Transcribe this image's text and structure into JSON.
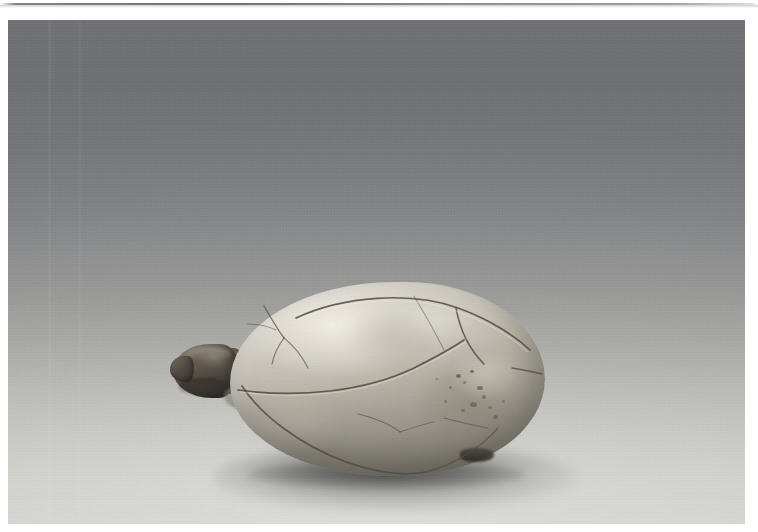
{
  "page": {
    "background_color": "#ffffff",
    "width": 758,
    "height": 532,
    "top_rule_color": "#7a7a7a"
  },
  "photograph": {
    "caption": "",
    "frame": {
      "left": 8,
      "top": 20,
      "width": 737,
      "height": 504
    },
    "backdrop": {
      "description": "seamless studio sweep, vertically graded",
      "top_color": "#77797d",
      "mid_color": "#a6a6a3",
      "bottom_color": "#d3d3cf"
    },
    "subject": {
      "name": "turtle shell",
      "description": "oval domed tortoise carapace resting on its plastron, head and neck protruding at the left, pointed tail end at the right",
      "material_tone": "ivory / bone",
      "highlight_color": "#e0ddd4",
      "midtone_color": "#b3afa3",
      "shadow_color": "#95917f",
      "head_color": "#4a443c",
      "features": [
        "vertebral scute seam running lengthwise across the crest",
        "costal scute seams radiating down the right flank",
        "marginal scute seam along the lower edge",
        "hairline cracks on the left shoulder",
        "dark pitted speckling on the lower right quadrant"
      ]
    },
    "shadow": {
      "description": "soft elliptical cast shadow beneath the shell",
      "color": "#4d4d4b"
    }
  }
}
